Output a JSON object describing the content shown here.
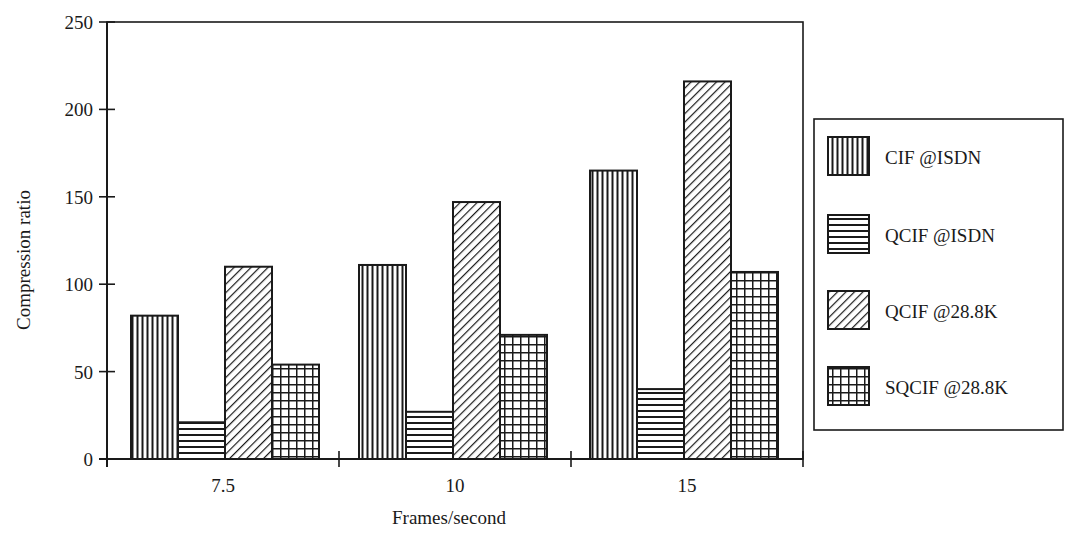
{
  "chart_data": {
    "type": "bar",
    "title": "",
    "xlabel": "Frames/second",
    "ylabel": "Compression ratio",
    "categories": [
      "7.5",
      "10",
      "15"
    ],
    "series": [
      {
        "name": "CIF @ISDN",
        "pattern": "vertical-lines",
        "values": [
          82,
          111,
          165
        ]
      },
      {
        "name": "QCIF @ISDN",
        "pattern": "horizontal-lines",
        "values": [
          21,
          27,
          40
        ]
      },
      {
        "name": "QCIF @28.8K",
        "pattern": "diagonal-lines",
        "values": [
          110,
          147,
          216
        ]
      },
      {
        "name": "SQCIF @28.8K",
        "pattern": "grid",
        "values": [
          54,
          71,
          107
        ]
      }
    ],
    "ylim": [
      0,
      250
    ],
    "yticks": [
      0,
      50,
      100,
      150,
      200,
      250
    ],
    "grid": false,
    "legend_position": "right",
    "colors": {
      "ink": "#1a1a1a",
      "background": "#ffffff"
    }
  }
}
